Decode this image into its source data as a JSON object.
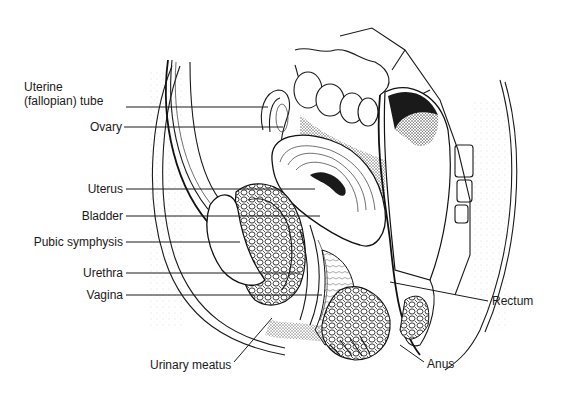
{
  "figure": {
    "labels": [
      {
        "id": "uterine-tube",
        "text_line1": "Uterine",
        "text_line2": "(fallopian) tube"
      },
      {
        "id": "ovary",
        "text": "Ovary"
      },
      {
        "id": "uterus",
        "text": "Uterus"
      },
      {
        "id": "bladder",
        "text": "Bladder"
      },
      {
        "id": "pubic-symphysis",
        "text": "Pubic symphysis"
      },
      {
        "id": "urethra",
        "text": "Urethra"
      },
      {
        "id": "vagina",
        "text": "Vagina"
      },
      {
        "id": "urinary-meatus",
        "text": "Urinary meatus"
      },
      {
        "id": "anus",
        "text": "Anus"
      },
      {
        "id": "rectum",
        "text": "Rectum"
      }
    ]
  },
  "colors": {
    "ink": "#1a1a1a",
    "background": "#ffffff"
  }
}
